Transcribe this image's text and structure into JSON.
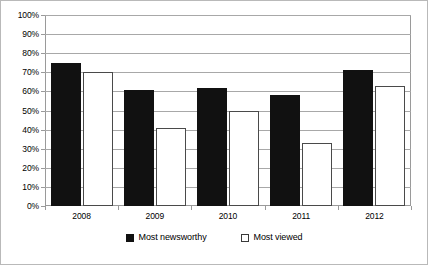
{
  "chart_data": {
    "type": "bar",
    "title": "",
    "subtitle": "",
    "xlabel": "",
    "ylabel": "",
    "categories": [
      "2008",
      "2009",
      "2010",
      "2011",
      "2012"
    ],
    "series": [
      {
        "name": "Most newsworthy",
        "color": "#111111",
        "fill": "solid",
        "values": [
          75,
          70,
          62,
          58,
          71
        ]
      },
      {
        "name": "Most viewed",
        "color": "#ffffff",
        "fill": "hollow",
        "values": [
          70,
          41,
          50,
          33,
          63
        ]
      }
    ],
    "ylim": [
      0,
      100
    ],
    "ytick_step": 10,
    "ytick_labels": [
      "0%",
      "10%",
      "20%",
      "30%",
      "40%",
      "50%",
      "60%",
      "70%",
      "80%",
      "90%",
      "100%"
    ],
    "ytick_values": [
      0,
      10,
      20,
      30,
      40,
      50,
      60,
      70,
      80,
      90,
      100
    ],
    "value_suffix": "%",
    "grid": true,
    "grid_axis": "y",
    "legend": true,
    "legend_position": "bottom-center",
    "annotations": []
  },
  "chart_data_corrected_2009_newsworthy": 61,
  "figure": {
    "background": "#ffffff",
    "border_color": "#b9b9b9",
    "gridline_color": "#a8a8a8",
    "axis_color": "#9a9a9a"
  }
}
